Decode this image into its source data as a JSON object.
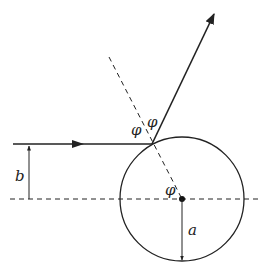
{
  "diagram": {
    "labels": {
      "impact_parameter": "b",
      "radius": "a",
      "angle_incident": "φ",
      "angle_reflected": "φ",
      "angle_center": "φ"
    },
    "colors": {
      "stroke": "#222222",
      "background": "#ffffff"
    },
    "geometry": {
      "circle_center": [
        182,
        199
      ],
      "circle_radius": 62,
      "impact_point": [
        152,
        144
      ],
      "incoming_ray_start": [
        13,
        144
      ],
      "reflected_ray_end": [
        214,
        14
      ],
      "normal_line_start": [
        109,
        57
      ],
      "axis_y": 199
    }
  }
}
